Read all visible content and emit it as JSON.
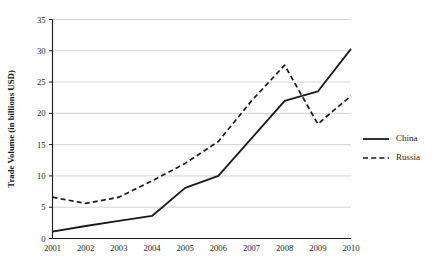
{
  "chart_data": {
    "type": "line",
    "title": "",
    "xlabel": "",
    "ylabel": "Trade Volume (in billions USD)",
    "categories": [
      "2001",
      "2002",
      "2003",
      "2004",
      "2005",
      "2006",
      "2007",
      "2008",
      "2009",
      "2010"
    ],
    "x": [
      2001,
      2002,
      2003,
      2004,
      2005,
      2006,
      2007,
      2008,
      2009,
      2010
    ],
    "xlim": [
      2001,
      2010
    ],
    "ylim": [
      0,
      35
    ],
    "yticks": [
      0,
      5,
      10,
      15,
      20,
      25,
      30,
      35
    ],
    "grid": "horizontal",
    "legend_position": "right",
    "series": [
      {
        "name": "China",
        "style": "solid",
        "color": "#1a1a1a",
        "values": [
          1.1,
          2.0,
          2.8,
          3.6,
          8.1,
          10.0,
          16.0,
          22.0,
          23.5,
          30.3
        ]
      },
      {
        "name": "Russia",
        "style": "dashed",
        "color": "#1a1a1a",
        "values": [
          6.6,
          5.6,
          6.6,
          9.2,
          12.0,
          15.5,
          22.0,
          27.7,
          18.3,
          22.8
        ]
      }
    ]
  },
  "axes": {
    "y_title": "Trade Volume (in billions USD)",
    "y_tick_labels": [
      "0",
      "5",
      "10",
      "15",
      "20",
      "25",
      "30",
      "35"
    ],
    "x_tick_labels": [
      "2001",
      "2002",
      "2003",
      "2004",
      "2005",
      "2006",
      "2007",
      "2008",
      "2009",
      "2010"
    ]
  },
  "legend": {
    "items": [
      {
        "label": "China",
        "style": "solid"
      },
      {
        "label": "Russia",
        "style": "dashed"
      }
    ]
  }
}
